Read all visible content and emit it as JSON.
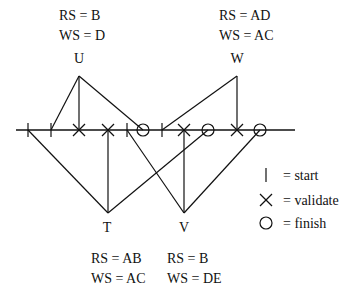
{
  "diagram": {
    "type": "transaction-validation-timeline",
    "timeline": {
      "y": 130,
      "x_start": 16,
      "x_end": 295
    },
    "markers": [
      {
        "kind": "start",
        "x": 28,
        "txn": "T"
      },
      {
        "kind": "start",
        "x": 51,
        "txn": "U"
      },
      {
        "kind": "validate",
        "x": 79,
        "txn": "U"
      },
      {
        "kind": "validate",
        "x": 108,
        "txn": "T"
      },
      {
        "kind": "start",
        "x": 127,
        "txn": "V"
      },
      {
        "kind": "finish",
        "x": 143,
        "txn": "U"
      },
      {
        "kind": "start",
        "x": 162,
        "txn": "W"
      },
      {
        "kind": "validate",
        "x": 184,
        "txn": "V"
      },
      {
        "kind": "finish",
        "x": 208,
        "txn": "T"
      },
      {
        "kind": "validate",
        "x": 237,
        "txn": "W"
      },
      {
        "kind": "finish",
        "x": 260,
        "txn": "V"
      }
    ],
    "transactions": [
      {
        "name": "U",
        "position": "top",
        "apex": [
          79,
          76
        ],
        "label_xy": [
          79,
          63
        ],
        "rs": "RS = B",
        "ws": "WS = D",
        "rs_xy": [
          59,
          20
        ],
        "ws_xy": [
          59,
          40
        ],
        "connects_to_x": [
          51,
          79,
          143
        ]
      },
      {
        "name": "W",
        "position": "top",
        "apex": [
          237,
          76
        ],
        "label_xy": [
          237,
          63
        ],
        "rs": "RS = AD",
        "ws": "WS = AC",
        "rs_xy": [
          219,
          20
        ],
        "ws_xy": [
          219,
          40
        ],
        "connects_to_x": [
          162,
          237
        ]
      },
      {
        "name": "T",
        "position": "bottom",
        "apex": [
          108,
          213
        ],
        "label_xy": [
          107,
          232
        ],
        "rs": "RS = AB",
        "ws": "WS = AC",
        "rs_xy": [
          91,
          263
        ],
        "ws_xy": [
          91,
          283
        ],
        "connects_to_x": [
          28,
          108,
          208
        ]
      },
      {
        "name": "V",
        "position": "bottom",
        "apex": [
          184,
          213
        ],
        "label_xy": [
          184,
          232
        ],
        "rs": "RS = B",
        "ws": "WS = DE",
        "rs_xy": [
          167,
          263
        ],
        "ws_xy": [
          167,
          283
        ],
        "connects_to_x": [
          127,
          184,
          260
        ]
      }
    ],
    "legend": [
      {
        "symbol": "start",
        "icon": "vertical-bar-icon",
        "text": "= start",
        "y": 175
      },
      {
        "symbol": "validate",
        "icon": "x-cross-icon",
        "text": "= validate",
        "y": 200
      },
      {
        "symbol": "finish",
        "icon": "circle-icon",
        "text": "= finish",
        "y": 223
      }
    ],
    "colors": {
      "ink": "#111111",
      "background": "#ffffff"
    }
  }
}
